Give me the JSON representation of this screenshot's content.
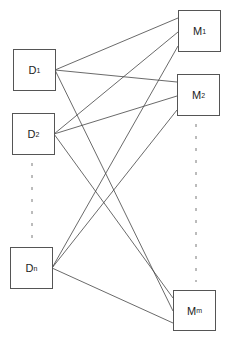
{
  "diagram": {
    "type": "bipartite-graph",
    "left_nodes": [
      {
        "id": "D1",
        "base": "D",
        "sub": "1"
      },
      {
        "id": "D2",
        "base": "D",
        "sub": "2"
      },
      {
        "id": "Dn",
        "base": "D",
        "sub": "n"
      }
    ],
    "right_nodes": [
      {
        "id": "M1",
        "base": "M",
        "sub": "1"
      },
      {
        "id": "M2",
        "base": "M",
        "sub": "2"
      },
      {
        "id": "Mm",
        "base": "M",
        "sub": "m"
      }
    ],
    "edges": [
      [
        "D1",
        "M1"
      ],
      [
        "D1",
        "M2"
      ],
      [
        "D1",
        "Mm"
      ],
      [
        "D2",
        "M1"
      ],
      [
        "D2",
        "M2"
      ],
      [
        "D2",
        "Mm"
      ],
      [
        "Dn",
        "M1"
      ],
      [
        "Dn",
        "M2"
      ],
      [
        "Dn",
        "Mm"
      ]
    ],
    "ellipsis_left": "vertical dashed",
    "ellipsis_right": "vertical dashed",
    "line_color": "#444444"
  }
}
